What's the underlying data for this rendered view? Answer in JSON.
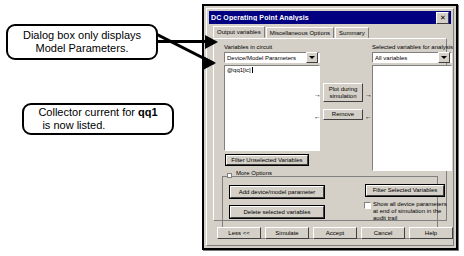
{
  "annotations": [
    {
      "id": "callout-1",
      "line1": "Dialog box only displays",
      "line2": "Model Parameters."
    },
    {
      "id": "callout-2",
      "line1_prefix": "Collector current for ",
      "line1_bold": "qq1",
      "line2": "is now listed."
    }
  ],
  "dialog": {
    "title": "DC Operating Point Analysis",
    "close_label": "✕",
    "tabs": [
      {
        "label": "Output variables",
        "active": true
      },
      {
        "label": "Miscellaneous Options",
        "active": false
      },
      {
        "label": "Summary",
        "active": false
      }
    ],
    "left_panel": {
      "label": "Variables in circuit",
      "combo_value": "Device/Model Parameters",
      "list_items": [
        "@qq1[ic]"
      ],
      "filter_button": "Filter Unselected Variables"
    },
    "right_panel": {
      "label": "Selected variables for analysis",
      "combo_value": "All variables",
      "list_items": []
    },
    "transfer": {
      "plot_button_line1": "Plot during",
      "plot_button_line2": "simulation",
      "remove_button": "Remove",
      "arrow_right": "→",
      "arrow_left": "←"
    },
    "more_options": {
      "group_label": "More Options",
      "add_button": "Add device/model parameter",
      "delete_button": "Delete selected variables",
      "filter_selected_button": "Filter Selected Variables",
      "checkbox_label_line1": "Show all device parameters",
      "checkbox_label_line2": "at end of simulation in the",
      "checkbox_label_line3": "audit trail",
      "checkbox_checked": false
    },
    "bottom_buttons": [
      "Less <<",
      "Simulate",
      "Accept",
      "Cancel",
      "Help"
    ]
  },
  "colors": {
    "titlebar": "#000080",
    "dialog_face": "#d4d0c8",
    "field_background": "#ffffff",
    "text": "#000000"
  }
}
